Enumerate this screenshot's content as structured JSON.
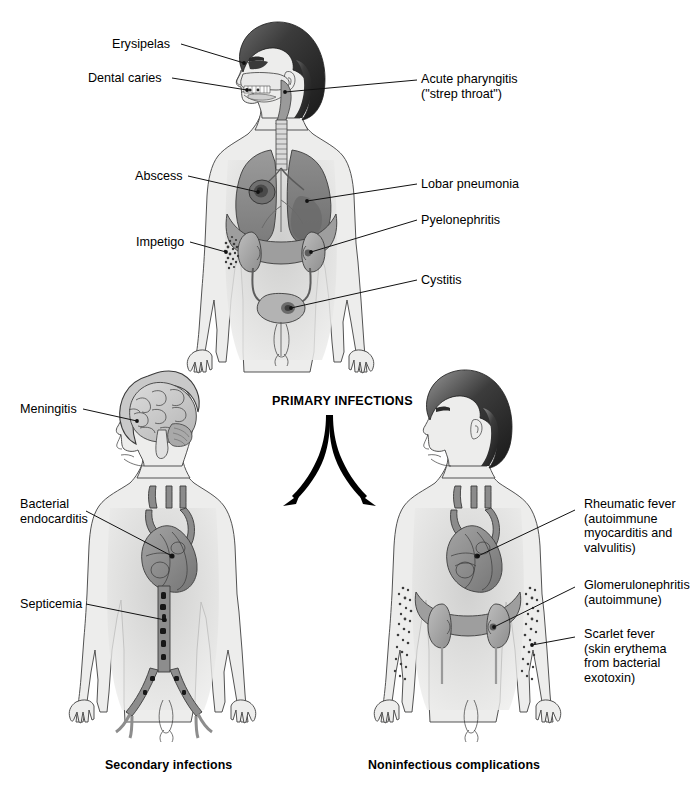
{
  "figure": {
    "title_center": "PRIMARY INFECTIONS",
    "panels": [
      {
        "id": "primary",
        "caption": ""
      },
      {
        "id": "secondary",
        "caption": "Secondary infections"
      },
      {
        "id": "noninfectious",
        "caption": "Noninfectious complications"
      }
    ]
  },
  "top_labels_left": [
    {
      "text": "Erysipelas",
      "x": 112,
      "y": 38
    },
    {
      "text": "Dental caries",
      "x": 88,
      "y": 71
    },
    {
      "text": "Abscess",
      "x": 135,
      "y": 169
    },
    {
      "text": "Impetigo",
      "x": 136,
      "y": 235
    }
  ],
  "top_labels_right": [
    {
      "text": "Acute pharyngitis\n(\"strep throat\")",
      "x": 420,
      "y": 72
    },
    {
      "text": "Lobar pneumonia",
      "x": 420,
      "y": 177
    },
    {
      "text": "Pyelonephritis",
      "x": 420,
      "y": 213
    },
    {
      "text": "Cystitis",
      "x": 420,
      "y": 273
    }
  ],
  "bottom_labels_left": [
    {
      "text": "Meningitis",
      "x": 20,
      "y": 402
    },
    {
      "text": "Bacterial\nendocarditis",
      "x": 20,
      "y": 497
    },
    {
      "text": "Septicemia",
      "x": 20,
      "y": 597
    }
  ],
  "bottom_labels_right": [
    {
      "text": "Rheumatic fever\n(autoimmune\nmyocarditis and\nvalvulitis)",
      "x": 578,
      "y": 497
    },
    {
      "text": "Glomerulonephritis\n(autoimmune)",
      "x": 578,
      "y": 578
    },
    {
      "text": "Scarlet fever\n(skin erythema\nfrom bacterial\nexotoxin)",
      "x": 578,
      "y": 627
    }
  ],
  "captions": {
    "secondary": "Secondary infections",
    "noninfectious": "Noninfectious complications"
  },
  "colors": {
    "background": "#ffffff",
    "ink": "#111111",
    "skin": "#ededec",
    "skin_shadow": "#e2e2e1",
    "organ_mid": "#8a8a8a",
    "organ_dark": "#6d6d6d",
    "organ_light": "#b9b9b9",
    "hair_dark": "#2b2b2b",
    "vessel": "#7b7b7b",
    "rash": "#3d3d3d"
  },
  "icons": {
    "arrow_left": "arrow-down-left-icon",
    "arrow_right": "arrow-down-right-icon"
  }
}
